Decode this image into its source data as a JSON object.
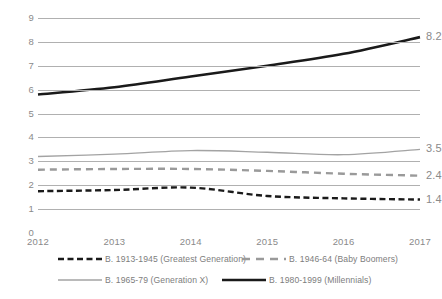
{
  "chart_data": {
    "type": "line",
    "title": "",
    "subtitle": "",
    "xlabel": "",
    "ylabel": "",
    "x": [
      "2012",
      "2013",
      "2014",
      "2015",
      "2016",
      "2017"
    ],
    "categories": [
      "2012",
      "2013",
      "2014",
      "2015",
      "2016",
      "2017"
    ],
    "ylim": [
      0,
      9
    ],
    "ytick_labels": [
      "0",
      "1",
      "2",
      "3",
      "4",
      "5",
      "6",
      "7",
      "8",
      "9"
    ],
    "ytick_values": [
      0,
      1,
      2,
      3,
      4,
      5,
      6,
      7,
      8,
      9
    ],
    "grid": true,
    "grid_axis": "y",
    "legend_position": "bottom",
    "series": [
      {
        "name": "B. 1913-1945 (Greatest Generation)",
        "short_name": "Greatest Generation",
        "values": [
          1.75,
          1.8,
          1.9,
          1.55,
          1.45,
          1.4
        ],
        "end_label": "1.4",
        "color": "#1a1a1a",
        "style": "dashed",
        "width": 2.4
      },
      {
        "name": "B. 1946-64 (Baby Boomers)",
        "short_name": "Baby Boomers",
        "values": [
          2.65,
          2.68,
          2.68,
          2.6,
          2.48,
          2.4
        ],
        "end_label": "2.4",
        "color": "#9a9a9a",
        "style": "dashed",
        "width": 2.4
      },
      {
        "name": "B. 1965-79 (Generation X)",
        "short_name": "Generation X",
        "values": [
          3.2,
          3.3,
          3.45,
          3.38,
          3.28,
          3.5
        ],
        "end_label": "3.5",
        "color": "#a3a3a3",
        "style": "solid",
        "width": 1.4
      },
      {
        "name": "B. 1980-1999 (Millennials)",
        "short_name": "Millennials",
        "values": [
          5.8,
          6.1,
          6.55,
          7.0,
          7.5,
          8.2
        ],
        "end_label": "8.2",
        "color": "#1a1a1a",
        "style": "solid",
        "width": 2.6
      }
    ]
  },
  "legend": {
    "rows": [
      [
        {
          "label": "B. 1913-1945 (Greatest Generation)",
          "swatch": "heavy-dash-black"
        },
        {
          "label": "B. 1946-64 (Baby Boomers)",
          "swatch": "wide-dash-gray"
        }
      ],
      [
        {
          "label": "B. 1965-79 (Generation X)",
          "swatch": "solid-thin-gray"
        },
        {
          "label": "B. 1980-1999 (Millennials)",
          "swatch": "solid-thick-black"
        }
      ]
    ]
  },
  "colors": {
    "gridline": "#b0b0b0",
    "tick_text": "#8a8a8a",
    "legend_text": "#7d7d7d",
    "background": "#ffffff"
  }
}
